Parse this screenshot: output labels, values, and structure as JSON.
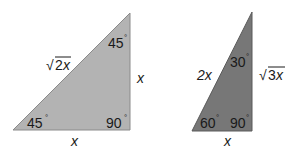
{
  "triangles": [
    {
      "name": "45-45-90",
      "fill": "#b3b3b3",
      "angles": {
        "top": "45",
        "bottom_left": "45",
        "right": "90"
      },
      "sides": {
        "hypotenuse_coef": "2",
        "hypotenuse_var": "x",
        "vertical": "x",
        "base": "x"
      }
    },
    {
      "name": "30-60-90",
      "fill": "#777777",
      "angles": {
        "top": "30",
        "bottom_left": "60",
        "right": "90"
      },
      "sides": {
        "hypotenuse": "2x",
        "vertical_coef": "3",
        "vertical_var": "x",
        "base": "x"
      }
    }
  ],
  "degree_symbol": "°",
  "sqrt_symbol": "√"
}
